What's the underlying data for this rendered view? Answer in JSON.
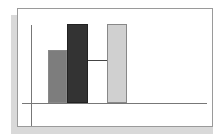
{
  "chart_data": {
    "type": "bar",
    "title": "",
    "xlabel": "",
    "ylabel": "",
    "categories": [
      "A",
      "B",
      "C"
    ],
    "values": [
      67,
      100,
      100
    ],
    "colors": [
      "#7d7d7d",
      "#333333",
      "#d0d0d0"
    ],
    "ylim": [
      0,
      100
    ],
    "grid": false,
    "legend": null,
    "annotations": [
      {
        "type": "horizontal-connector",
        "from_bar": 1,
        "to_bar": 2,
        "level": 54
      }
    ],
    "tick_labels_visible": false
  },
  "layout": {
    "plot_left": 22,
    "plot_right": 207,
    "baseline_y": 103,
    "top_y": 24,
    "bars": [
      {
        "x": 48,
        "width": 19
      },
      {
        "x": 67,
        "width": 21
      },
      {
        "x": 107,
        "width": 20
      }
    ]
  }
}
